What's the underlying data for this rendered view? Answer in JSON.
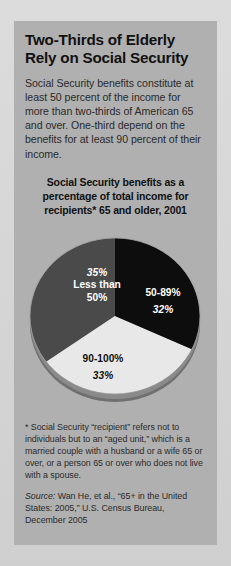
{
  "panel": {
    "background_color": "#b0b0b0",
    "headline_line1": "Two-Thirds of Elderly",
    "headline_line2": "Rely on Social Security",
    "lede": "Social Security benefits constitute at least 50 percent of the income for more than two-thirds of American 65 and over. One-third depend on the benefits for at least 90 percent of their income.",
    "footnote": "* Social Security “recipient” refers not to individuals but to an “aged unit,” which is a married couple with a husband or a wife 65 or over, or a person 65 or over who does not live with a spouse.",
    "source_lead": "Source:",
    "source_text": " Wan He, et al., “65+ in the United States: 2005,” U.S. Census Bureau, December 2005"
  },
  "chart_data": {
    "type": "pie",
    "title": "Social Security benefits as a percentage of total income for recipients* 65 and older, 2001",
    "title_line1": "Social Security benefits as a",
    "title_line2": "percentage of total income for",
    "title_line3": "recipients* 65 and older, 2001",
    "categories": [
      "50-89%",
      "Less than 50%",
      "90-100%"
    ],
    "values": [
      32,
      35,
      33
    ],
    "value_labels": [
      "32%",
      "35%",
      "33%"
    ],
    "unit": "percent of recipients",
    "legend": "none",
    "slices": [
      {
        "category_label": "50-89%",
        "percent_label": "32%",
        "value": 32,
        "color": "#0d0d0d",
        "text_color": "#ffffff"
      },
      {
        "category_line1": "Less than",
        "category_line2": "50%",
        "category_label": "Less than 50%",
        "percent_label": "35%",
        "value": 35,
        "color": "#4a4a4a",
        "text_color": "#ffffff"
      },
      {
        "category_label": "90-100%",
        "percent_label": "33%",
        "value": 33,
        "color": "#e8e8e8",
        "text_color": "#111111"
      }
    ]
  }
}
